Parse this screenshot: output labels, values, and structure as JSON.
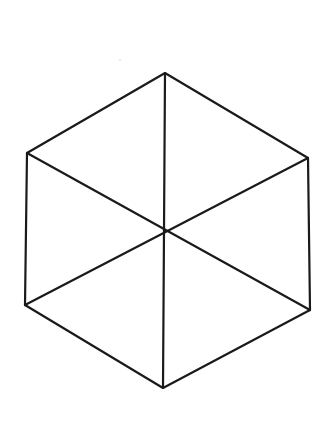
{
  "diagram": {
    "stroke_color": "#1a1a1a",
    "stroke_width": 2.2,
    "background": "#ffffff",
    "vertices": {
      "top": [
        165,
        73
      ],
      "upper_right": [
        308,
        158
      ],
      "lower_right": [
        310,
        310
      ],
      "bottom": [
        163,
        388
      ],
      "lower_left": [
        25,
        305
      ],
      "upper_left": [
        27,
        153
      ],
      "center": [
        166,
        232
      ]
    }
  }
}
